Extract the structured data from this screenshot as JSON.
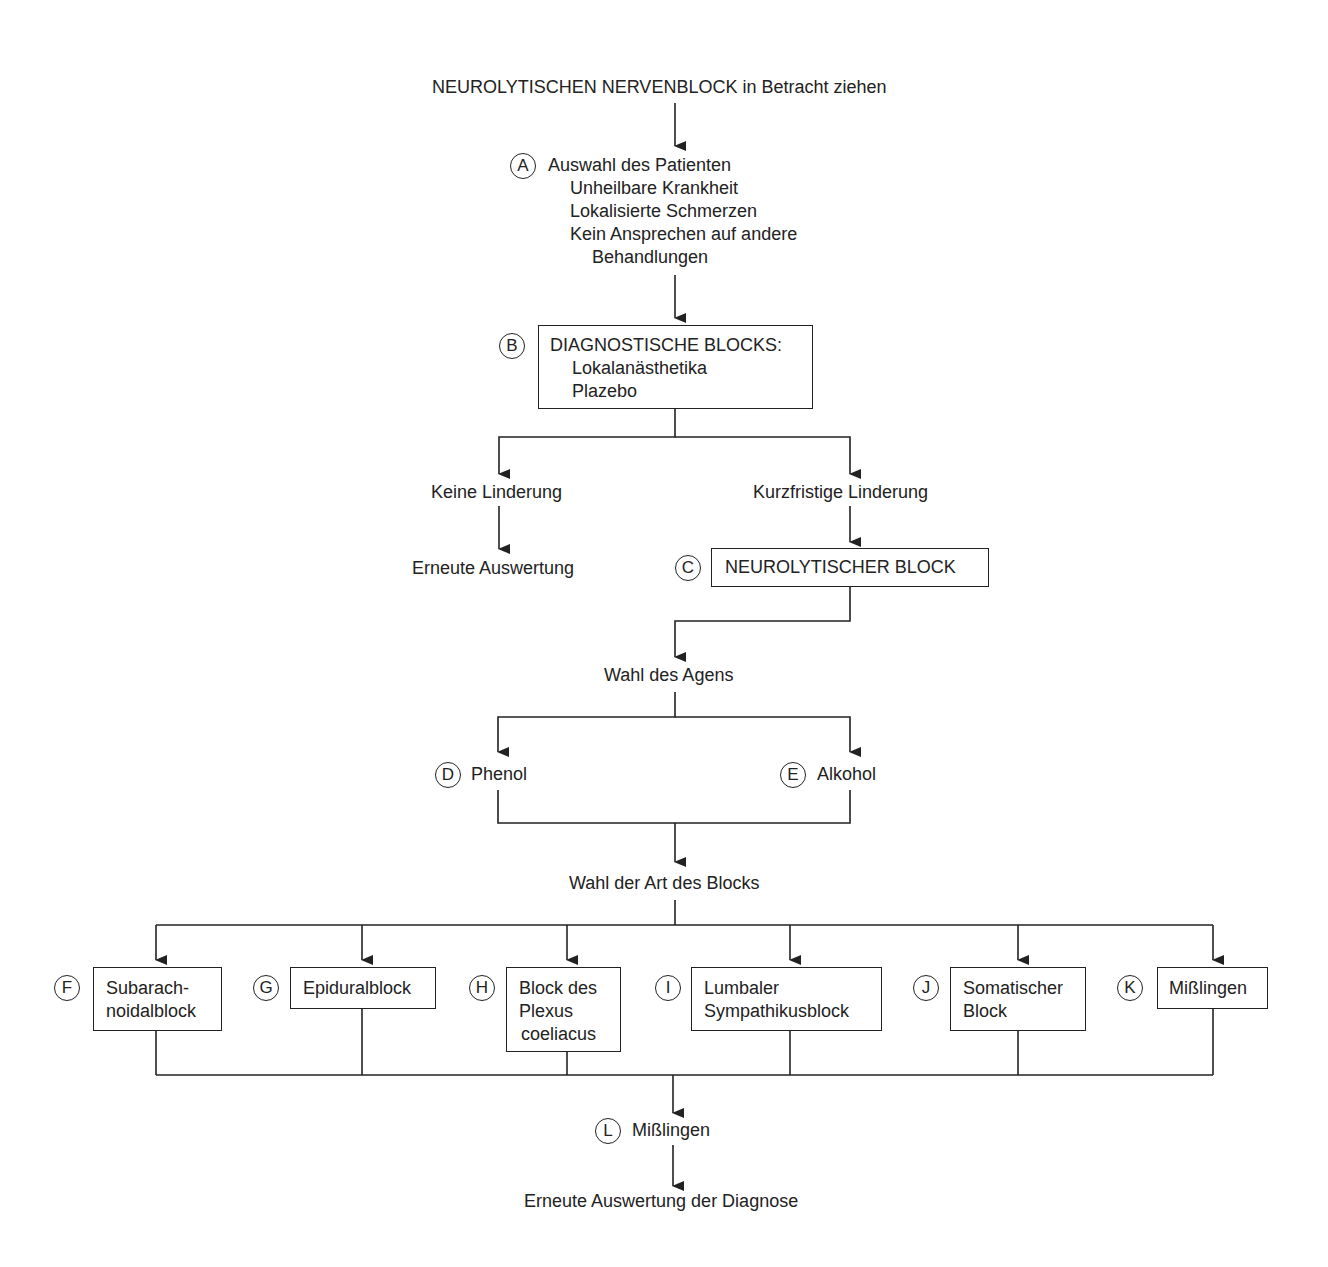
{
  "title": "NEUROLYTISCHEN NERVENBLOCK in Betracht ziehen",
  "step_a": {
    "marker": "A",
    "heading": "Auswahl des Patienten",
    "criteria": [
      "Unheilbare Krankheit",
      "Lokalisierte Schmerzen",
      "Kein Ansprechen auf andere",
      "Behandlungen"
    ]
  },
  "step_b": {
    "marker": "B",
    "heading": "DIAGNOSTISCHE BLOCKS:",
    "items": [
      "Lokalanästhetika",
      "Plazebo"
    ]
  },
  "branch_no_relief": {
    "label": "Keine Linderung",
    "outcome": "Erneute Auswertung"
  },
  "branch_short_relief": {
    "label": "Kurzfristige Linderung"
  },
  "step_c": {
    "marker": "C",
    "label": "NEUROLYTISCHER BLOCK"
  },
  "agent_choice": {
    "label": "Wahl des Agens"
  },
  "step_d": {
    "marker": "D",
    "label": "Phenol"
  },
  "step_e": {
    "marker": "E",
    "label": "Alkohol"
  },
  "block_type_choice": {
    "label": "Wahl der Art des Blocks"
  },
  "block_types": [
    {
      "marker": "F",
      "lines": [
        "Subarach-",
        "noidalblock"
      ]
    },
    {
      "marker": "G",
      "lines": [
        "Epiduralblock"
      ]
    },
    {
      "marker": "H",
      "lines": [
        "Block des",
        "Plexus",
        "coeliacus"
      ]
    },
    {
      "marker": "I",
      "lines": [
        "Lumbaler",
        "Sympathikusblock"
      ]
    },
    {
      "marker": "J",
      "lines": [
        "Somatischer",
        "Block"
      ]
    },
    {
      "marker": "K",
      "lines": [
        "Mißlingen"
      ]
    }
  ],
  "step_l": {
    "marker": "L",
    "label": "Mißlingen"
  },
  "final": {
    "label": "Erneute Auswertung der Diagnose"
  },
  "colors": {
    "ink": "#222222",
    "background": "#ffffff"
  }
}
